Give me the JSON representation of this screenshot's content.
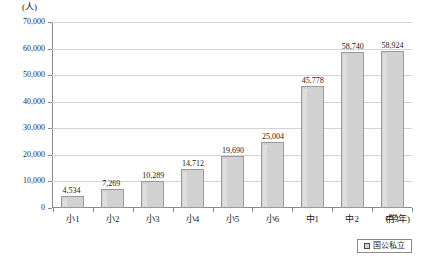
{
  "chart_data": {
    "type": "bar",
    "title": "",
    "subtitle": "",
    "xlabel": "(学年)",
    "ylabel": "(人)",
    "categories": [
      "小1",
      "小2",
      "小3",
      "小4",
      "小5",
      "小6",
      "中1",
      "中2",
      "中3"
    ],
    "values": [
      4534,
      7269,
      10289,
      14712,
      19690,
      25004,
      45778,
      58740,
      58924
    ],
    "value_labels": [
      "4,534",
      "7,269",
      "10,289",
      "14,712",
      "19,690",
      "25,004",
      "45,778",
      "58,740",
      "58,924"
    ],
    "ylim": [
      0,
      70000
    ],
    "ytick_values": [
      0,
      10000,
      20000,
      30000,
      40000,
      50000,
      60000,
      70000
    ],
    "ytick_labels": [
      "0",
      "10,000",
      "20,000",
      "30,000",
      "40,000",
      "50,000",
      "60,000",
      "70,000"
    ],
    "grid": true,
    "legend": {
      "position": "bottom-right",
      "entries": [
        {
          "label": "国公私立",
          "color": "#d2d2d2"
        }
      ]
    },
    "series": [
      {
        "name": "国公私立",
        "color": "#d2d2d2"
      }
    ],
    "colors": {
      "bar_fill": "#d2d2d2",
      "bar_border": "#9a9a9a",
      "gridline": "#d4d4d4",
      "axis": "#8a8a8a",
      "text": "#1a1a1a",
      "background": "#ffffff"
    }
  }
}
